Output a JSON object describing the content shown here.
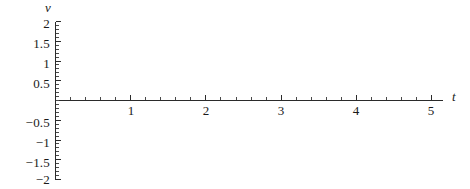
{
  "chart_data": {
    "type": "line",
    "title": "",
    "xlabel": "t",
    "ylabel": "v",
    "xlim": [
      0,
      5.17
    ],
    "ylim": [
      -2,
      2
    ],
    "grid": false,
    "legend": null,
    "series": [],
    "annotations": [],
    "x_ticks": [
      {
        "value": 1,
        "label": "1"
      },
      {
        "value": 2,
        "label": "2"
      },
      {
        "value": 3,
        "label": "3"
      },
      {
        "value": 4,
        "label": "4"
      },
      {
        "value": 5,
        "label": "5"
      }
    ],
    "x_minor_step": 0.2,
    "y_ticks": [
      {
        "value": 2,
        "label": "2"
      },
      {
        "value": 1.5,
        "label": "1.5"
      },
      {
        "value": 1,
        "label": "1"
      },
      {
        "value": 0.5,
        "label": "0.5"
      },
      {
        "value": -0.5,
        "label": "−0.5"
      },
      {
        "value": -1,
        "label": "−1"
      },
      {
        "value": -1.5,
        "label": "−1.5"
      },
      {
        "value": -2,
        "label": "−2"
      }
    ],
    "y_minor_step": 0.1
  },
  "axis_labels": {
    "y_name": "v",
    "x_name": "t"
  },
  "ticks": {
    "y": {
      "t_2": "2",
      "t_15": "1.5",
      "t_1": "1",
      "t_05": "0.5",
      "t_m05": "−0.5",
      "t_m1": "−1",
      "t_m15": "−1.5",
      "t_m2": "−2"
    },
    "x": {
      "t_1": "1",
      "t_2": "2",
      "t_3": "3",
      "t_4": "4",
      "t_5": "5"
    }
  },
  "colors": {
    "axis": "#2b2b2b",
    "minor_tick": "#4a4a4a",
    "background": "#ffffff",
    "text": "#1a1a1a"
  }
}
